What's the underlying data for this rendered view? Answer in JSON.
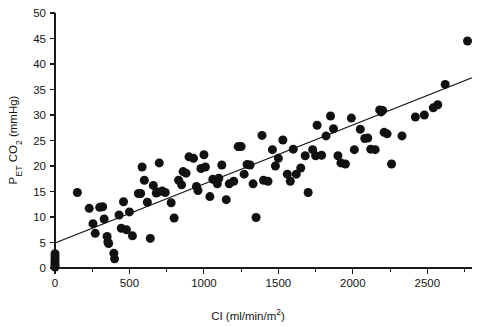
{
  "chart_data": {
    "type": "scatter",
    "title": "",
    "xlabel": "CI (ml/min/m2)",
    "xlabel_parts": {
      "prefix": "CI (ml/min/m",
      "superscript": "2",
      "suffix": ")"
    },
    "ylabel": "PET CO2 (mmHg)",
    "ylabel_parts": {
      "p": "P",
      "et": "ET",
      "co": " CO",
      "two": "2",
      "units": " (mmHg)"
    },
    "xlim": [
      0,
      2800
    ],
    "ylim": [
      0,
      50
    ],
    "xticks": [
      0,
      500,
      1000,
      1500,
      2000,
      2500
    ],
    "xticklabels": [
      "0",
      "500",
      "1000",
      "1500",
      "2000",
      "2500"
    ],
    "xminorticks": [
      250,
      750,
      1250,
      1750,
      2250,
      2750
    ],
    "yticks": [
      0,
      5,
      10,
      15,
      20,
      25,
      30,
      35,
      40,
      45,
      50
    ],
    "yticklabels": [
      "0",
      "5",
      "10",
      "15",
      "20",
      "25",
      "30",
      "35",
      "40",
      "45",
      "50"
    ],
    "grid": false,
    "legend": null,
    "marker": "circle",
    "marker_color": "#111111",
    "marker_size_px": 9,
    "fit_line": {
      "name": "regression line",
      "color": "#111111",
      "x": [
        0,
        2800
      ],
      "y": [
        4.9,
        37.3
      ]
    },
    "points": [
      [
        0,
        0.2
      ],
      [
        0,
        0.6
      ],
      [
        0,
        1.1
      ],
      [
        0,
        1.6
      ],
      [
        0,
        2.2
      ],
      [
        0,
        2.8
      ],
      [
        150,
        14.8
      ],
      [
        230,
        11.7
      ],
      [
        255,
        8.7
      ],
      [
        270,
        6.8
      ],
      [
        300,
        11.9
      ],
      [
        320,
        12.0
      ],
      [
        330,
        9.6
      ],
      [
        350,
        6.2
      ],
      [
        355,
        5.1
      ],
      [
        360,
        4.8
      ],
      [
        395,
        2.9
      ],
      [
        400,
        1.8
      ],
      [
        430,
        10.4
      ],
      [
        445,
        7.8
      ],
      [
        460,
        13.0
      ],
      [
        480,
        7.5
      ],
      [
        500,
        11.0
      ],
      [
        520,
        6.3
      ],
      [
        560,
        14.6
      ],
      [
        575,
        14.6
      ],
      [
        585,
        19.8
      ],
      [
        600,
        17.2
      ],
      [
        620,
        12.9
      ],
      [
        640,
        5.8
      ],
      [
        660,
        16.2
      ],
      [
        680,
        14.7
      ],
      [
        690,
        14.9
      ],
      [
        700,
        20.6
      ],
      [
        720,
        15.1
      ],
      [
        740,
        14.8
      ],
      [
        780,
        12.8
      ],
      [
        800,
        9.8
      ],
      [
        830,
        17.2
      ],
      [
        850,
        16.3
      ],
      [
        860,
        18.9
      ],
      [
        880,
        18.6
      ],
      [
        900,
        21.8
      ],
      [
        930,
        21.5
      ],
      [
        950,
        16.0
      ],
      [
        960,
        15.2
      ],
      [
        980,
        19.5
      ],
      [
        1000,
        22.2
      ],
      [
        1010,
        19.8
      ],
      [
        1040,
        14.0
      ],
      [
        1060,
        17.4
      ],
      [
        1090,
        16.5
      ],
      [
        1100,
        17.6
      ],
      [
        1120,
        20.2
      ],
      [
        1150,
        13.4
      ],
      [
        1170,
        16.5
      ],
      [
        1200,
        17.0
      ],
      [
        1230,
        23.8
      ],
      [
        1250,
        23.8
      ],
      [
        1270,
        18.4
      ],
      [
        1290,
        20.3
      ],
      [
        1310,
        20.2
      ],
      [
        1330,
        16.5
      ],
      [
        1350,
        9.9
      ],
      [
        1390,
        26.0
      ],
      [
        1400,
        17.2
      ],
      [
        1430,
        17.0
      ],
      [
        1460,
        23.2
      ],
      [
        1480,
        20.0
      ],
      [
        1500,
        21.5
      ],
      [
        1530,
        25.1
      ],
      [
        1560,
        18.4
      ],
      [
        1580,
        17.0
      ],
      [
        1600,
        23.3
      ],
      [
        1620,
        18.4
      ],
      [
        1650,
        19.6
      ],
      [
        1680,
        22.0
      ],
      [
        1700,
        14.8
      ],
      [
        1730,
        23.2
      ],
      [
        1750,
        22.0
      ],
      [
        1760,
        28.0
      ],
      [
        1790,
        22.1
      ],
      [
        1820,
        25.9
      ],
      [
        1850,
        29.8
      ],
      [
        1870,
        27.3
      ],
      [
        1900,
        22.0
      ],
      [
        1920,
        20.6
      ],
      [
        1950,
        20.4
      ],
      [
        1990,
        29.4
      ],
      [
        2010,
        23.2
      ],
      [
        2050,
        27.2
      ],
      [
        2080,
        25.4
      ],
      [
        2100,
        25.5
      ],
      [
        2120,
        23.3
      ],
      [
        2150,
        23.2
      ],
      [
        2180,
        31.0
      ],
      [
        2190,
        30.6
      ],
      [
        2200,
        30.9
      ],
      [
        2210,
        26.6
      ],
      [
        2230,
        26.3
      ],
      [
        2260,
        20.4
      ],
      [
        2330,
        25.9
      ],
      [
        2420,
        29.6
      ],
      [
        2480,
        30.0
      ],
      [
        2540,
        31.4
      ],
      [
        2570,
        32.0
      ],
      [
        2620,
        36.0
      ],
      [
        2770,
        44.5
      ]
    ]
  }
}
